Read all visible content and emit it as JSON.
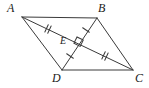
{
  "figure": {
    "name": "parallelogram-with-bisecting-diagonals",
    "width": 149,
    "height": 88,
    "background_color": "#ffffff",
    "stroke_color": "#3a3a3a",
    "stroke_width": 1,
    "label_color": "#1a1a1a"
  },
  "points": {
    "A": {
      "label": "A",
      "x": 22,
      "y": 17,
      "label_x": 7,
      "label_y": 2
    },
    "B": {
      "label": "B",
      "x": 97,
      "y": 18,
      "label_x": 98,
      "label_y": 2
    },
    "C": {
      "label": "C",
      "x": 133,
      "y": 70,
      "label_x": 135,
      "label_y": 72
    },
    "D": {
      "label": "D",
      "x": 62,
      "y": 70,
      "label_x": 52,
      "label_y": 72
    },
    "E": {
      "label": "E",
      "x": 77,
      "y": 43,
      "label_x": 60,
      "label_y": 36
    }
  },
  "sides": [
    {
      "name": "side-AB",
      "from": "A",
      "to": "B"
    },
    {
      "name": "side-BC",
      "from": "B",
      "to": "C"
    },
    {
      "name": "side-CD",
      "from": "C",
      "to": "D"
    },
    {
      "name": "side-DA",
      "from": "D",
      "to": "A"
    }
  ],
  "diagonals": [
    {
      "name": "diagonal-AC",
      "from": "A",
      "to": "C"
    },
    {
      "name": "diagonal-BD",
      "from": "B",
      "to": "D"
    }
  ],
  "tick_marks": [
    {
      "name": "tick-segment-AE",
      "segment": "AE",
      "count": 2,
      "x": 48,
      "y": 29,
      "angle": 30
    },
    {
      "name": "tick-segment-EC",
      "segment": "EC",
      "count": 2,
      "x": 105,
      "y": 55,
      "angle": 30
    },
    {
      "name": "tick-segment-BE",
      "segment": "BE",
      "count": 1,
      "x": 86,
      "y": 30,
      "angle": -55
    },
    {
      "name": "tick-segment-ED",
      "segment": "ED",
      "count": 1,
      "x": 70,
      "y": 56,
      "angle": -55
    }
  ],
  "angle_markers": [
    {
      "name": "right-angle-marker-at-E",
      "type": "right-angle",
      "x": 77,
      "y": 37,
      "size": 7,
      "rotation": 30
    }
  ],
  "relationships": {
    "congruent_double_tick": "AE = EC",
    "congruent_single_tick": "BE = ED",
    "perpendicular": "AC ⊥ BD at E"
  }
}
